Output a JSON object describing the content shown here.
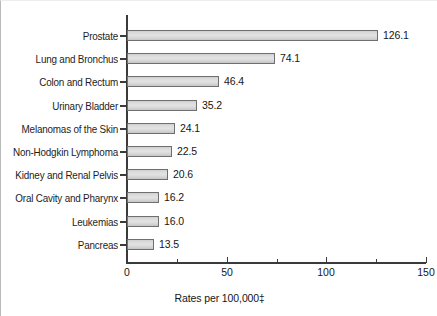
{
  "chart_data": {
    "type": "bar",
    "orientation": "horizontal",
    "title": "",
    "subtitle": "",
    "xlabel": "Rates per 100,000‡",
    "ylabel": "",
    "xlim": [
      0,
      150
    ],
    "xticks": [
      0,
      50,
      100,
      150
    ],
    "xtick_labels": [
      "0",
      "50",
      "100",
      "150"
    ],
    "xminor_ticks": [
      25,
      75,
      125
    ],
    "grid": false,
    "legend": false,
    "categories": [
      "Prostate",
      "Lung and Bronchus",
      "Colon and Rectum",
      "Urinary Bladder",
      "Melanomas of the Skin",
      "Non-Hodgkin Lymphoma",
      "Kidney and Renal Pelvis",
      "Oral Cavity and Pharynx",
      "Leukemias",
      "Pancreas"
    ],
    "values": [
      126.1,
      74.1,
      46.4,
      35.2,
      24.1,
      22.5,
      20.6,
      16.2,
      16.0,
      13.5
    ],
    "value_labels": [
      "126.1",
      "74.1",
      "46.4",
      "35.2",
      "24.1",
      "22.5",
      "20.6",
      "16.2",
      "16.0",
      "13.5"
    ],
    "colors": {
      "bar_fill": "#dcdcdc",
      "bar_border": "#6f6f6f",
      "axis": "#3a3a3a",
      "text": "#161616",
      "background": "#ffffff"
    }
  },
  "axis": {
    "x_title_text": "Rates per 100,000",
    "x_title_dagger": "‡"
  }
}
